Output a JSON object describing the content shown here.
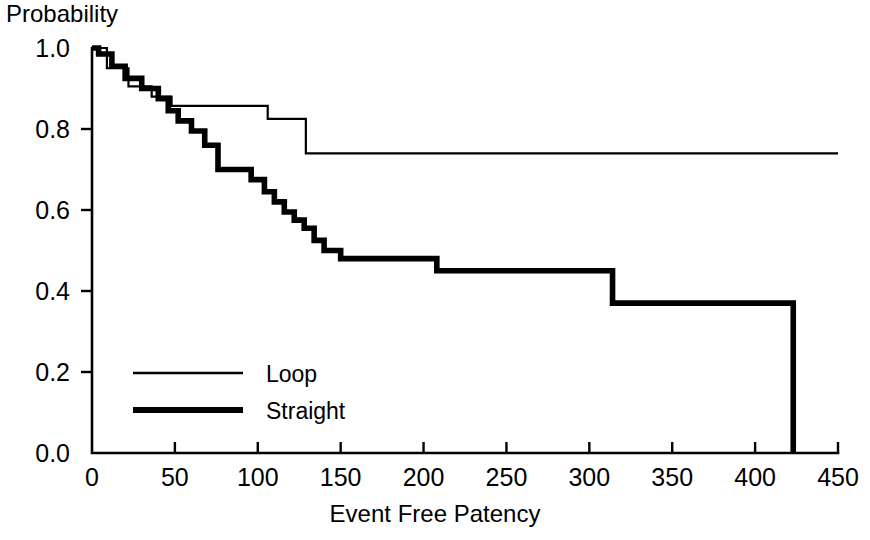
{
  "chart_data": {
    "type": "line",
    "title": "",
    "xlabel": "Event Free Patency",
    "ylabel": "Probability",
    "xlim": [
      0,
      450
    ],
    "ylim": [
      0.0,
      1.0
    ],
    "grid": false,
    "legend_position": "inside-lower-left",
    "xticks": [
      0,
      50,
      100,
      150,
      200,
      250,
      300,
      350,
      400,
      450
    ],
    "xtick_labels": [
      "0",
      "50",
      "100",
      "150",
      "200",
      "250",
      "300",
      "350",
      "400",
      "450"
    ],
    "yticks": [
      0.0,
      0.2,
      0.4,
      0.6,
      0.8,
      1.0
    ],
    "ytick_labels": [
      "0.0",
      "0.2",
      "0.4",
      "0.6",
      "0.8",
      "1.0"
    ],
    "series": [
      {
        "name": "Loop",
        "style": "thin",
        "x": [
          0,
          9,
          9,
          22,
          22,
          36,
          36,
          48,
          48,
          106,
          106,
          129,
          129,
          450
        ],
        "y": [
          1.0,
          1.0,
          0.95,
          0.95,
          0.905,
          0.905,
          0.88,
          0.88,
          0.857,
          0.857,
          0.825,
          0.825,
          0.74,
          0.74
        ]
      },
      {
        "name": "Straight",
        "style": "thick",
        "x": [
          0,
          4,
          4,
          12,
          12,
          20,
          20,
          30,
          30,
          40,
          40,
          46,
          46,
          52,
          52,
          60,
          60,
          68,
          68,
          76,
          76,
          96,
          96,
          104,
          104,
          110,
          110,
          116,
          116,
          122,
          122,
          128,
          128,
          134,
          134,
          140,
          140,
          150,
          150,
          208,
          208,
          314,
          314,
          423,
          423
        ],
        "y": [
          1.0,
          1.0,
          0.985,
          0.985,
          0.955,
          0.955,
          0.925,
          0.925,
          0.9,
          0.9,
          0.875,
          0.875,
          0.845,
          0.845,
          0.82,
          0.82,
          0.795,
          0.795,
          0.76,
          0.76,
          0.7,
          0.7,
          0.675,
          0.675,
          0.645,
          0.645,
          0.62,
          0.62,
          0.595,
          0.595,
          0.575,
          0.575,
          0.555,
          0.555,
          0.525,
          0.525,
          0.5,
          0.5,
          0.48,
          0.48,
          0.45,
          0.45,
          0.37,
          0.37,
          0.0
        ]
      }
    ],
    "annotations": []
  },
  "legend": {
    "entries": [
      {
        "label": "Loop",
        "style": "thin"
      },
      {
        "label": "Straight",
        "style": "thick"
      }
    ]
  },
  "colors": {
    "line": "#000000",
    "axis": "#000000",
    "background": "#ffffff"
  }
}
